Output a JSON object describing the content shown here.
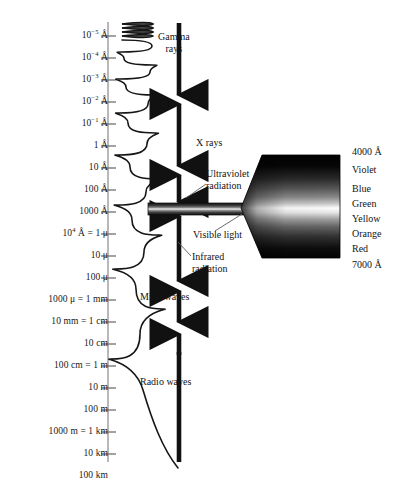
{
  "figure": {
    "background_color": "#ffffff",
    "ink_color": "#141414",
    "axis_color": "#8f8f8f"
  },
  "scale": {
    "name": "wavelength-scale",
    "orientation": "vertical",
    "direction": "increasing wavelength downward",
    "ticks": [
      {
        "label": "10⁻⁵ Å",
        "base": "10",
        "exponent": "-5",
        "unit": "Å",
        "y": 38
      },
      {
        "label": "10⁻⁴ Å",
        "base": "10",
        "exponent": "-4",
        "unit": "Å",
        "y": 61
      },
      {
        "label": "10⁻³ Å",
        "base": "10",
        "exponent": "-3",
        "unit": "Å",
        "y": 84
      },
      {
        "label": "10⁻² Å",
        "base": "10",
        "exponent": "-2",
        "unit": "Å",
        "y": 107
      },
      {
        "label": "10⁻¹ Å",
        "base": "10",
        "exponent": "-1",
        "unit": "Å",
        "y": 130
      },
      {
        "label": "1 Å",
        "base": "",
        "exponent": "",
        "unit": "Å",
        "y": 153
      },
      {
        "label": "10 Å",
        "base": "",
        "exponent": "",
        "unit": "Å",
        "y": 176
      },
      {
        "label": "100 Å",
        "base": "",
        "exponent": "",
        "unit": "Å",
        "y": 199
      },
      {
        "label": "1000 Å",
        "base": "",
        "exponent": "",
        "unit": "Å",
        "y": 222
      },
      {
        "label": "10⁴ Å = 1 μ",
        "base": "10",
        "exponent": "4",
        "unit": "Å",
        "y": 245
      },
      {
        "label": "10 μ",
        "base": "",
        "exponent": "",
        "unit": "μ",
        "y": 268
      },
      {
        "label": "100 μ",
        "base": "",
        "exponent": "",
        "unit": "μ",
        "y": 291
      },
      {
        "label": "1000 μ = 1 mm",
        "base": "",
        "exponent": "",
        "unit": "mm",
        "y": 314
      },
      {
        "label": "10 mm = 1 cm",
        "base": "",
        "exponent": "",
        "unit": "cm",
        "y": 337
      },
      {
        "label": "10 cm",
        "base": "",
        "exponent": "",
        "unit": "cm",
        "y": 360
      },
      {
        "label": "100 cm = 1 m",
        "base": "",
        "exponent": "",
        "unit": "m",
        "y": 383
      },
      {
        "label": "10 m",
        "base": "",
        "exponent": "",
        "unit": "m",
        "y": 406
      },
      {
        "label": "100 m",
        "base": "",
        "exponent": "",
        "unit": "m",
        "y": 429
      },
      {
        "label": "1000 m = 1 km",
        "base": "",
        "exponent": "",
        "unit": "km",
        "y": 452
      },
      {
        "label": "10 km",
        "base": "",
        "exponent": "",
        "unit": "km",
        "y": 475
      },
      {
        "label": "100 km",
        "base": "",
        "exponent": "",
        "unit": "km",
        "y": 498
      }
    ]
  },
  "wave": {
    "name": "sinusoidal-wave",
    "description": "Sine wave whose wavelength increases from top to bottom, illustrating the logarithmic wavelength scale",
    "stroke_color": "#161616",
    "stroke_width": 1.5
  },
  "bands": [
    {
      "name": "gamma-rays",
      "label": "Gamma\nrays",
      "line1": "Gamma",
      "line2": "rays",
      "label_x": 196,
      "label_y": 34,
      "label_align": "left"
    },
    {
      "name": "x-rays",
      "label": "X rays",
      "line1": "X rays",
      "line2": "",
      "label_x": 196,
      "label_y": 143,
      "label_align": "left"
    },
    {
      "name": "ultraviolet-radiation",
      "label": "Ultraviolet\nradiation",
      "line1": "Ultraviolet",
      "line2": "radiation",
      "label_x": 208,
      "label_y": 175,
      "label_align": "left"
    },
    {
      "name": "visible-light",
      "label": "Visible light",
      "line1": "Visible light",
      "line2": "",
      "label_x": 193,
      "label_y": 235,
      "label_align": "left"
    },
    {
      "name": "infrared-radiation",
      "label": "Infrared\nradiation",
      "line1": "Infrared",
      "line2": "radiation",
      "label_x": 193,
      "label_y": 258,
      "label_align": "left"
    },
    {
      "name": "microwaves",
      "label": "Microwaves",
      "line1": "Microwaves",
      "line2": "",
      "label_x": 143,
      "label_y": 296,
      "label_align": "left"
    },
    {
      "name": "radio-waves",
      "label": "Radio waves",
      "line1": "Radio waves",
      "line2": "",
      "label_x": 143,
      "label_y": 381,
      "label_align": "left"
    }
  ],
  "spectrum_fan": {
    "name": "visible-light-dispersion-fan",
    "description": "Grayscale halftone fan showing the visible spectrum spread from the narrow visible-light band",
    "top_wavelength": "4000 Å",
    "bottom_wavelength": "7000 Å",
    "colors": [
      {
        "name": "Violet",
        "y": 160
      },
      {
        "name": "Blue",
        "y": 183
      },
      {
        "name": "Green",
        "y": 198
      },
      {
        "name": "Yellow",
        "y": 214
      },
      {
        "name": "Orange",
        "y": 231
      },
      {
        "name": "Red",
        "y": 247
      }
    ],
    "edge_labels": [
      {
        "text": "4000 Å",
        "y": 152
      },
      {
        "text": "7000 Å",
        "y": 261
      }
    ]
  }
}
